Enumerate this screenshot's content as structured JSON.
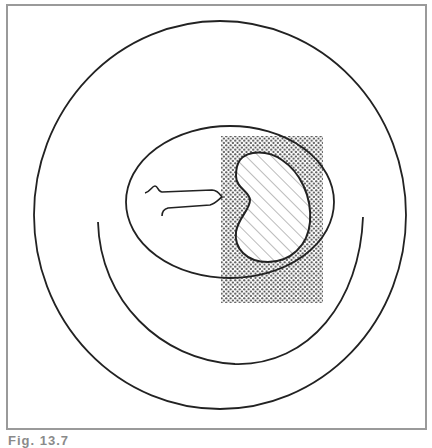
{
  "figure": {
    "caption": "Fig. 13.7",
    "frame": {
      "x": 7,
      "y": 5,
      "width": 419,
      "height": 424,
      "stroke": "#9a9a9a"
    },
    "outer_circle": {
      "cx": 220,
      "cy": 215,
      "rx": 186,
      "ry": 194,
      "stroke": "#222222"
    },
    "inner_arc": {
      "stroke": "#222222"
    },
    "ellipse": {
      "cx": 230,
      "cy": 202,
      "rx": 104,
      "ry": 76,
      "stroke": "#222222"
    },
    "dotted_region": {
      "x": 221,
      "y": 136,
      "width": 102,
      "height": 167,
      "dot_color": "#444444"
    },
    "hatched_bean": {
      "stroke": "#222222",
      "hatch_color": "#777777"
    },
    "probe": {
      "stroke": "#222222"
    }
  }
}
